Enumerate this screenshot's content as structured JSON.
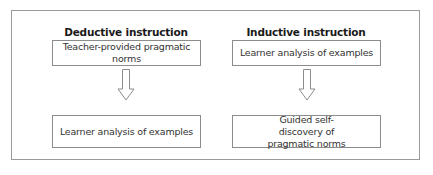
{
  "diagram": {
    "columns": [
      {
        "heading": "Deductive instruction",
        "top_box": "Teacher-provided pragmatic norms",
        "bottom_box": "Learner analysis of examples"
      },
      {
        "heading": "Inductive instruction",
        "top_box": "Learner analysis of examples",
        "bottom_box": "Guided self-discovery of pragmatic norms"
      }
    ],
    "arrow_icon": "down-arrow-outline",
    "colors": {
      "border": "#8c8c8c",
      "frame": "#9a9a9a",
      "text": "#333333"
    }
  }
}
